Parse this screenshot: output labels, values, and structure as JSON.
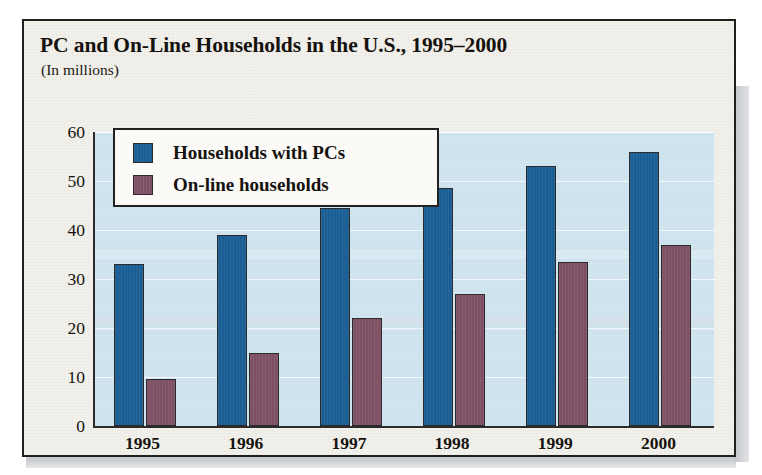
{
  "figure": {
    "title": "PC and On-Line Households in the U.S., 1995–2000",
    "subtitle": "(In millions)"
  },
  "legend": {
    "items": [
      {
        "label": "Households with PCs",
        "color": "#1b5e93",
        "swatch_name": "legend-swatch-households-with-pcs"
      },
      {
        "label": "On-line households",
        "color": "#7e5064",
        "swatch_name": "legend-swatch-online-households"
      }
    ]
  },
  "axes": {
    "y_ticks": [
      "0",
      "10",
      "20",
      "30",
      "40",
      "50",
      "60"
    ],
    "x_ticks": [
      "1995",
      "1996",
      "1997",
      "1998",
      "1999",
      "2000"
    ]
  },
  "colors": {
    "pc_bar": "#1b5e93",
    "online_bar": "#7e5064",
    "plot_background": "#cfe3ef",
    "figure_background": "#f2f0ea",
    "frame": "#20201f"
  },
  "chart_data": {
    "type": "bar",
    "title": "PC and On-Line Households in the U.S., 1995–2000",
    "subtitle": "(In millions)",
    "xlabel": "",
    "ylabel": "",
    "ylim": [
      0,
      60
    ],
    "yticks": [
      0,
      10,
      20,
      30,
      40,
      50,
      60
    ],
    "grid": true,
    "legend_position": "top-left-inside",
    "categories": [
      "1995",
      "1996",
      "1997",
      "1998",
      "1999",
      "2000"
    ],
    "series": [
      {
        "name": "Households with PCs",
        "color": "#1b5e93",
        "values": [
          33,
          39,
          44.5,
          48.5,
          53,
          56
        ]
      },
      {
        "name": "On-line households",
        "color": "#7e5064",
        "values": [
          9.5,
          15,
          22,
          27,
          33.5,
          37
        ]
      }
    ]
  }
}
